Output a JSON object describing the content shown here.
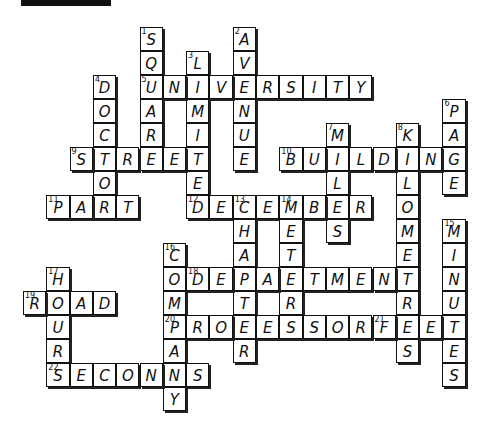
{
  "title_bar": {
    "color": "#111111"
  },
  "grid": {
    "origin_x": 23,
    "origin_y": 27,
    "cell_w": 23.3,
    "cell_h": 24
  },
  "words": [
    {
      "num": "1",
      "answer": "SQUARE",
      "dir": "down",
      "col": 5,
      "row": 0
    },
    {
      "num": "2",
      "answer": "AVENUE",
      "dir": "down",
      "col": 9,
      "row": 0
    },
    {
      "num": "3",
      "answer": "LIMITED",
      "dir": "down",
      "col": 7,
      "row": 1
    },
    {
      "num": "4",
      "answer": "DOCTOR",
      "dir": "down",
      "col": 3,
      "row": 2
    },
    {
      "num": "5",
      "answer": "UNIVERSITY",
      "dir": "across",
      "col": 5,
      "row": 2
    },
    {
      "num": "6",
      "answer": "PAGE",
      "dir": "down",
      "col": 18,
      "row": 3
    },
    {
      "num": "7",
      "answer": "MILES",
      "dir": "down",
      "col": 13,
      "row": 4
    },
    {
      "num": "8",
      "answer": "KILOMETRES",
      "dir": "down",
      "col": 16,
      "row": 4
    },
    {
      "num": "9",
      "answer": "STREET",
      "dir": "across",
      "col": 2,
      "row": 5
    },
    {
      "num": "10",
      "answer": "BUILDING",
      "dir": "across",
      "col": 11,
      "row": 5
    },
    {
      "num": "11",
      "answer": "PART",
      "dir": "across",
      "col": 1,
      "row": 7
    },
    {
      "num": "12",
      "answer": "DECEMBER",
      "dir": "across",
      "col": 7,
      "row": 7
    },
    {
      "num": "13",
      "answer": "CHAPTER",
      "dir": "down",
      "col": 9,
      "row": 7
    },
    {
      "num": "14",
      "answer": "METER",
      "dir": "down",
      "col": 11,
      "row": 7
    },
    {
      "num": "15",
      "answer": "MINUTES",
      "dir": "down",
      "col": 18,
      "row": 8
    },
    {
      "num": "16",
      "answer": "COMPANY",
      "dir": "down",
      "col": 6,
      "row": 9
    },
    {
      "num": "17",
      "answer": "HOUR",
      "dir": "down",
      "col": 1,
      "row": 10
    },
    {
      "num": "18",
      "answer": "DEPARTMENT",
      "dir": "across",
      "col": 7,
      "row": 10
    },
    {
      "num": "19",
      "answer": "ROAD",
      "dir": "across",
      "col": 0,
      "row": 11
    },
    {
      "num": "20",
      "answer": "PROFESSOR",
      "dir": "across",
      "col": 6,
      "row": 12
    },
    {
      "num": "21",
      "answer": "FEET",
      "dir": "across",
      "col": 15,
      "row": 12
    },
    {
      "num": "22",
      "answer": "SECONDS",
      "dir": "across",
      "col": 1,
      "row": 14
    }
  ]
}
